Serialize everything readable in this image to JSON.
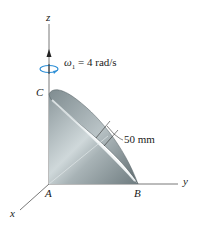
{
  "diagram": {
    "type": "3d-mechanics-figure",
    "axes": {
      "x": "x",
      "y": "y",
      "z": "z"
    },
    "points": {
      "A": "A",
      "B": "B",
      "C": "C"
    },
    "angular_velocity": {
      "symbol": "ω",
      "subscript": "1",
      "equation": "= 4 rad/s"
    },
    "dimension": "50 mm",
    "colors": {
      "axis": "#555555",
      "cone_dark": "#7d8a8e",
      "cone_light": "#dfe6e8",
      "rotation_arrow": "#2e8fd6"
    }
  }
}
